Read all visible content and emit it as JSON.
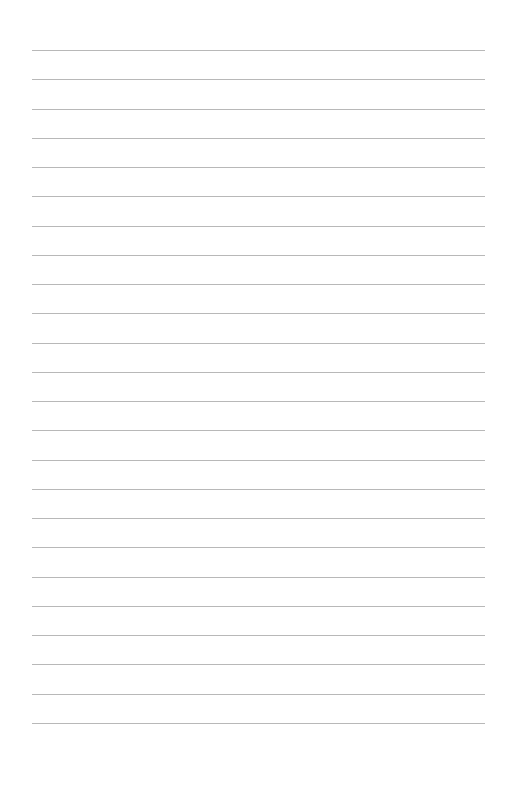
{
  "page": {
    "type": "lined-paper",
    "background_color": "#ffffff",
    "rule_color": "#b8b8b8",
    "rule_count": 24,
    "first_rule_y": 50,
    "rule_spacing": 29.26,
    "rule_left": 32,
    "rule_right": 485,
    "text": []
  }
}
